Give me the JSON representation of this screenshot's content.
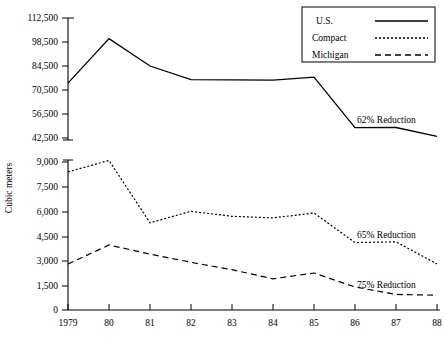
{
  "chart_data": {
    "type": "line",
    "title": "",
    "xlabel": "",
    "ylabel": "Cubic meters",
    "grid": false,
    "legend_position": "top-right",
    "x": [
      "1979",
      "80",
      "81",
      "82",
      "83",
      "84",
      "85",
      "86",
      "87",
      "88"
    ],
    "xtick_labels": [
      "1979",
      "80",
      "81",
      "82",
      "83",
      "84",
      "85",
      "86",
      "87",
      "88"
    ],
    "broken_axis": true,
    "axis_segments": [
      {
        "name": "lower",
        "ylim": [
          0,
          9000
        ],
        "ticks": [
          0,
          1500,
          3000,
          4500,
          6000,
          7500,
          9000
        ],
        "tick_labels": [
          "0",
          "1,500",
          "3,000",
          "4,500",
          "6,000",
          "7,500",
          "9,000"
        ]
      },
      {
        "name": "upper",
        "ylim": [
          42500,
          112500
        ],
        "ticks": [
          42500,
          56500,
          70500,
          84500,
          98500,
          112500
        ],
        "tick_labels": [
          "42,500",
          "56,500",
          "70,500",
          "84,500",
          "98,500",
          "112,500"
        ]
      }
    ],
    "series": [
      {
        "name": "U.S.",
        "style": "solid",
        "axis": "upper",
        "values": [
          74500,
          100500,
          84500,
          76500,
          76400,
          76300,
          78000,
          48500,
          48600,
          43500
        ],
        "annotation": "62% Reduction"
      },
      {
        "name": "Compact",
        "style": "dotted",
        "axis": "lower",
        "values": [
          8400,
          9100,
          5300,
          6000,
          5700,
          5600,
          5900,
          4100,
          4150,
          2800
        ],
        "annotation": "65% Reduction"
      },
      {
        "name": "Michigan",
        "style": "dashed",
        "axis": "lower",
        "values": [
          2800,
          3950,
          3400,
          2900,
          2450,
          1900,
          2250,
          1400,
          950,
          900
        ],
        "annotation": "75% Reduction"
      }
    ],
    "annotations": [
      {
        "text": "62% Reduction",
        "series": "U.S."
      },
      {
        "text": "65% Reduction",
        "series": "Compact"
      },
      {
        "text": "75% Reduction",
        "series": "Michigan"
      }
    ]
  },
  "legend": {
    "entries": [
      {
        "label": "U.S.",
        "style": "solid"
      },
      {
        "label": "Compact",
        "style": "dotted"
      },
      {
        "label": "Michigan",
        "style": "dashed"
      }
    ]
  },
  "yaxis": {
    "title": "Cubic meters",
    "labels_upper": [
      "112,500",
      "98,500",
      "84,500",
      "70,500",
      "56,500",
      "42,500"
    ],
    "labels_lower": [
      "9,000",
      "7,500",
      "6,000",
      "4,500",
      "3,000",
      "1,500",
      "0"
    ]
  },
  "xaxis": {
    "labels": [
      "1979",
      "80",
      "81",
      "82",
      "83",
      "84",
      "85",
      "86",
      "87",
      "88"
    ]
  }
}
